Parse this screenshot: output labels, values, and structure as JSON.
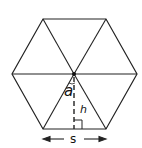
{
  "diagram": {
    "stroke_color": "#222222",
    "background": "#ffffff",
    "labels": {
      "angle": "a",
      "height": "h",
      "side": "s"
    },
    "vertices": {
      "top_left": [
        43,
        19
      ],
      "top_right": [
        106,
        19
      ],
      "right": [
        137,
        74
      ],
      "bottom_right": [
        106,
        129
      ],
      "bottom_left": [
        43,
        129
      ],
      "left": [
        12,
        74
      ]
    },
    "center": [
      74,
      74
    ]
  }
}
